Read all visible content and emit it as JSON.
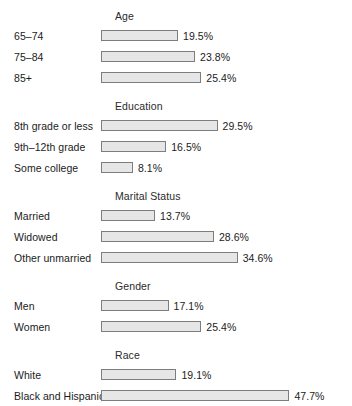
{
  "chart_data": {
    "type": "bar",
    "orientation": "horizontal",
    "title": "",
    "xlabel": "",
    "ylabel": "",
    "xlim": [
      0,
      47.7
    ],
    "grid": false,
    "legend": null,
    "value_suffix": "%",
    "groups": [
      {
        "name": "Age",
        "categories": [
          "65–74",
          "75–84",
          "85+"
        ],
        "values": [
          19.5,
          23.8,
          25.4
        ],
        "value_labels": [
          "19.5%",
          "23.8%",
          "25.4%"
        ]
      },
      {
        "name": "Education",
        "categories": [
          "8th grade or less",
          "9th–12th grade",
          "Some college"
        ],
        "values": [
          29.5,
          16.5,
          8.1
        ],
        "value_labels": [
          "29.5%",
          "16.5%",
          "8.1%"
        ]
      },
      {
        "name": "Marital Status",
        "categories": [
          "Married",
          "Widowed",
          "Other unmarried"
        ],
        "values": [
          13.7,
          28.6,
          34.6
        ],
        "value_labels": [
          "13.7%",
          "28.6%",
          "34.6%"
        ]
      },
      {
        "name": "Gender",
        "categories": [
          "Men",
          "Women"
        ],
        "values": [
          17.1,
          25.4
        ],
        "value_labels": [
          "17.1%",
          "25.4%"
        ]
      },
      {
        "name": "Race",
        "categories": [
          "White",
          "Black and Hispanic"
        ],
        "values": [
          19.1,
          47.7
        ],
        "value_labels": [
          "19.1%",
          "47.7%"
        ]
      }
    ]
  },
  "style": {
    "bar_fill": "#e6e6e6",
    "bar_border": "#7d7d7d",
    "text_color": "#1b1b1b",
    "background": "#ffffff",
    "px_per_percent": 3.95
  }
}
